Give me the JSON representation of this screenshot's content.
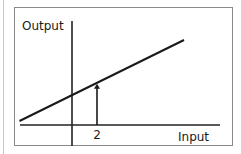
{
  "chart_data": {
    "type": "line",
    "title": "",
    "xlabel": "Input",
    "ylabel": "Output",
    "x_ticks": [
      "2"
    ],
    "grid": false,
    "legend": "none",
    "xlim": [
      -4.2,
      11.8
    ],
    "ylim": [
      -1.6,
      8.3
    ],
    "series": [
      {
        "name": "Output line",
        "x": [
          -4.2,
          8.96
        ],
        "y": [
          0.32,
          6.8
        ]
      }
    ],
    "annotations": [
      {
        "type": "arrow",
        "x": 2,
        "from_y": 0,
        "to_y": 3.3,
        "label": "2"
      }
    ]
  }
}
